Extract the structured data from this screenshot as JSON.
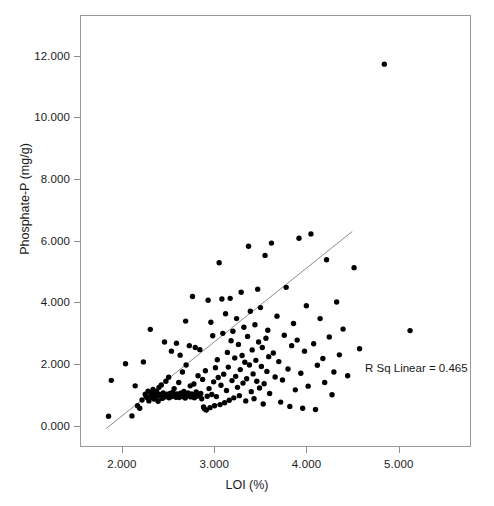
{
  "chart_data": {
    "type": "scatter",
    "title": "",
    "xlabel": "LOI (%)",
    "ylabel": "Phosphate-P (mg/g)",
    "xlim": [
      1.545,
      5.783
    ],
    "ylim": [
      -0.69,
      13.32
    ],
    "xticks": [
      "2.000",
      "3.000",
      "4.000",
      "5.000"
    ],
    "xtick_values": [
      2.0,
      3.0,
      4.0,
      5.0
    ],
    "yticks": [
      "0.000",
      "2.000",
      "4.000",
      "6.000",
      "8.000",
      "10.000",
      "12.000"
    ],
    "ytick_values": [
      0.0,
      2.0,
      4.0,
      6.0,
      8.0,
      10.0,
      12.0
    ],
    "grid": false,
    "legend": null,
    "annotations": [
      {
        "text": "R Sq Linear = 0.465",
        "x": 4.35,
        "y": 1.05
      }
    ],
    "marker": {
      "shape": "circle",
      "color": "#000000",
      "size": 5.4
    },
    "fit_line": {
      "type": "linear",
      "r_squared": 0.465,
      "color": "#8c8c8c",
      "x_start": 1.82,
      "y_start": -0.12,
      "x_end": 4.5,
      "y_end": 6.3
    },
    "series": [
      {
        "name": "Phosphate-P vs LOI",
        "points": [
          [
            1.845,
            0.28
          ],
          [
            1.875,
            1.45
          ],
          [
            2.03,
            1.99
          ],
          [
            2.1,
            0.29
          ],
          [
            2.135,
            1.27
          ],
          [
            2.16,
            0.62
          ],
          [
            2.185,
            0.54
          ],
          [
            2.21,
            0.81
          ],
          [
            2.225,
            2.05
          ],
          [
            2.245,
            1.0
          ],
          [
            2.255,
            0.93
          ],
          [
            2.265,
            0.88
          ],
          [
            2.275,
            1.1
          ],
          [
            2.285,
            0.78
          ],
          [
            2.3,
            3.11
          ],
          [
            2.305,
            1.05
          ],
          [
            2.31,
            0.97
          ],
          [
            2.32,
            0.9
          ],
          [
            2.33,
            1.15
          ],
          [
            2.34,
            0.84
          ],
          [
            2.35,
            1.02
          ],
          [
            2.355,
            0.95
          ],
          [
            2.36,
            0.89
          ],
          [
            2.37,
            1.08
          ],
          [
            2.385,
            0.77
          ],
          [
            2.395,
            1.22
          ],
          [
            2.4,
            0.99
          ],
          [
            2.41,
            0.93
          ],
          [
            2.42,
            1.3
          ],
          [
            2.43,
            0.86
          ],
          [
            2.44,
            1.04
          ],
          [
            2.45,
            0.96
          ],
          [
            2.455,
            2.7
          ],
          [
            2.46,
            0.91
          ],
          [
            2.47,
            1.42
          ],
          [
            2.48,
            1.0
          ],
          [
            2.49,
            0.94
          ],
          [
            2.5,
            1.55
          ],
          [
            2.505,
            0.88
          ],
          [
            2.515,
            1.02
          ],
          [
            2.52,
            0.97
          ],
          [
            2.53,
            2.4
          ],
          [
            2.535,
            0.92
          ],
          [
            2.545,
            1.06
          ],
          [
            2.55,
            0.99
          ],
          [
            2.56,
            1.18
          ],
          [
            2.57,
            0.95
          ],
          [
            2.58,
            0.9
          ],
          [
            2.585,
            2.66
          ],
          [
            2.59,
            1.01
          ],
          [
            2.6,
            0.96
          ],
          [
            2.61,
            1.38
          ],
          [
            2.615,
            0.89
          ],
          [
            2.625,
            2.27
          ],
          [
            2.63,
            1.03
          ],
          [
            2.64,
            0.98
          ],
          [
            2.65,
            1.72
          ],
          [
            2.655,
            0.92
          ],
          [
            2.665,
            1.09
          ],
          [
            2.67,
            1.0
          ],
          [
            2.68,
            0.87
          ],
          [
            2.685,
            3.38
          ],
          [
            2.69,
            1.95
          ],
          [
            2.7,
            0.94
          ],
          [
            2.71,
            1.04
          ],
          [
            2.72,
            0.99
          ],
          [
            2.725,
            2.58
          ],
          [
            2.735,
            1.27
          ],
          [
            2.74,
            0.91
          ],
          [
            2.75,
            1.01
          ],
          [
            2.76,
            4.18
          ],
          [
            2.765,
            0.96
          ],
          [
            2.775,
            1.33
          ],
          [
            2.78,
            0.88
          ],
          [
            2.79,
            2.52
          ],
          [
            2.8,
            1.07
          ],
          [
            2.81,
            0.93
          ],
          [
            2.82,
            1.6
          ],
          [
            2.83,
            0.99
          ],
          [
            2.84,
            2.45
          ],
          [
            2.85,
            1.02
          ],
          [
            2.86,
            0.85
          ],
          [
            2.87,
            1.48
          ],
          [
            2.88,
            0.58
          ],
          [
            2.89,
            0.52
          ],
          [
            2.9,
            1.76
          ],
          [
            2.91,
            0.48
          ],
          [
            2.92,
            0.93
          ],
          [
            2.93,
            4.06
          ],
          [
            2.94,
            1.18
          ],
          [
            2.95,
            0.56
          ],
          [
            2.96,
            3.34
          ],
          [
            2.97,
            0.99
          ],
          [
            2.98,
            2.9
          ],
          [
            2.99,
            1.4
          ],
          [
            3.0,
            0.62
          ],
          [
            3.01,
            1.86
          ],
          [
            3.02,
            0.92
          ],
          [
            3.03,
            2.12
          ],
          [
            3.04,
            1.54
          ],
          [
            3.05,
            5.28
          ],
          [
            3.06,
            0.66
          ],
          [
            3.07,
            1.29
          ],
          [
            3.08,
            4.1
          ],
          [
            3.09,
            2.98
          ],
          [
            3.1,
            1.65
          ],
          [
            3.11,
            0.72
          ],
          [
            3.12,
            3.62
          ],
          [
            3.13,
            1.12
          ],
          [
            3.14,
            2.36
          ],
          [
            3.15,
            1.88
          ],
          [
            3.16,
            0.8
          ],
          [
            3.17,
            4.12
          ],
          [
            3.18,
            2.74
          ],
          [
            3.19,
            1.44
          ],
          [
            3.2,
            3.05
          ],
          [
            3.21,
            0.88
          ],
          [
            3.22,
            2.18
          ],
          [
            3.23,
            1.58
          ],
          [
            3.24,
            3.46
          ],
          [
            3.25,
            1.22
          ],
          [
            3.26,
            2.62
          ],
          [
            3.27,
            0.95
          ],
          [
            3.28,
            1.8
          ],
          [
            3.29,
            4.32
          ],
          [
            3.3,
            2.26
          ],
          [
            3.31,
            1.36
          ],
          [
            3.32,
            3.18
          ],
          [
            3.33,
            2.04
          ],
          [
            3.34,
            0.78
          ],
          [
            3.35,
            1.5
          ],
          [
            3.36,
            2.88
          ],
          [
            3.37,
            5.82
          ],
          [
            3.38,
            1.95
          ],
          [
            3.39,
            3.7
          ],
          [
            3.4,
            1.08
          ],
          [
            3.41,
            2.44
          ],
          [
            3.42,
            1.66
          ],
          [
            3.43,
            0.85
          ],
          [
            3.44,
            3.26
          ],
          [
            3.45,
            2.1
          ],
          [
            3.46,
            1.42
          ],
          [
            3.47,
            4.42
          ],
          [
            3.48,
            2.7
          ],
          [
            3.49,
            1.2
          ],
          [
            3.5,
            3.82
          ],
          [
            3.51,
            1.9
          ],
          [
            3.52,
            2.52
          ],
          [
            3.53,
            0.68
          ],
          [
            3.54,
            1.34
          ],
          [
            3.55,
            5.52
          ],
          [
            3.56,
            2.82
          ],
          [
            3.57,
            1.74
          ],
          [
            3.58,
            3.08
          ],
          [
            3.59,
            2.22
          ],
          [
            3.6,
            1.02
          ],
          [
            3.62,
            5.92
          ],
          [
            3.64,
            2.34
          ],
          [
            3.66,
            1.56
          ],
          [
            3.68,
            3.54
          ],
          [
            3.7,
            2.06
          ],
          [
            3.72,
            0.74
          ],
          [
            3.74,
            1.46
          ],
          [
            3.76,
            2.92
          ],
          [
            3.78,
            4.48
          ],
          [
            3.8,
            1.82
          ],
          [
            3.82,
            0.6
          ],
          [
            3.84,
            2.58
          ],
          [
            3.86,
            3.3
          ],
          [
            3.88,
            1.14
          ],
          [
            3.9,
            2.76
          ],
          [
            3.92,
            6.08
          ],
          [
            3.94,
            1.68
          ],
          [
            3.96,
            0.54
          ],
          [
            3.98,
            2.4
          ],
          [
            4.0,
            3.88
          ],
          [
            4.02,
            1.26
          ],
          [
            4.05,
            6.22
          ],
          [
            4.08,
            2.64
          ],
          [
            4.1,
            0.5
          ],
          [
            4.12,
            1.94
          ],
          [
            4.15,
            3.46
          ],
          [
            4.18,
            2.16
          ],
          [
            4.2,
            1.38
          ],
          [
            4.22,
            5.38
          ],
          [
            4.25,
            2.86
          ],
          [
            4.28,
            0.98
          ],
          [
            4.3,
            1.72
          ],
          [
            4.33,
            4.0
          ],
          [
            4.36,
            2.28
          ],
          [
            4.4,
            3.12
          ],
          [
            4.45,
            1.6
          ],
          [
            4.52,
            5.12
          ],
          [
            4.58,
            2.48
          ],
          [
            4.85,
            11.75
          ],
          [
            5.13,
            3.07
          ]
        ]
      }
    ]
  },
  "axes": {
    "y_title": "Phosphate-P (mg/g)",
    "x_title": "LOI (%)"
  }
}
